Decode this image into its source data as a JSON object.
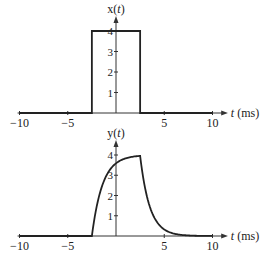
{
  "chart_data": [
    {
      "type": "line",
      "title": "",
      "ylabel": "x(t)",
      "xlabel": "t (ms)",
      "xlim": [
        -10,
        10
      ],
      "ylim": [
        0,
        4
      ],
      "x_ticks": [
        "-10",
        "-5",
        "5",
        "10"
      ],
      "y_ticks": [
        "1",
        "2",
        "3",
        "4"
      ],
      "grid": false,
      "series": [
        {
          "name": "x(t)",
          "x": [
            -10,
            -2.5,
            -2.5,
            2.5,
            2.5,
            10
          ],
          "values": [
            0,
            0,
            4,
            4,
            0,
            0
          ]
        }
      ]
    },
    {
      "type": "line",
      "title": "",
      "ylabel": "y(t)",
      "xlabel": "t (ms)",
      "xlim": [
        -10,
        10
      ],
      "ylim": [
        0,
        4
      ],
      "x_ticks": [
        "-10",
        "-5",
        "5",
        "10"
      ],
      "y_ticks": [
        "1",
        "2",
        "3",
        "4"
      ],
      "grid": false,
      "series": [
        {
          "name": "y(t)",
          "x": [
            -10,
            -2.5,
            -2,
            -1.5,
            -1,
            -0.5,
            0,
            1,
            2,
            2.5,
            3,
            3.5,
            4,
            5,
            6,
            7,
            8,
            10
          ],
          "values": [
            0,
            0,
            1.7,
            2.6,
            3.1,
            3.45,
            3.65,
            3.85,
            3.95,
            3.98,
            2.4,
            1.45,
            0.9,
            0.33,
            0.12,
            0.04,
            0.01,
            0
          ]
        }
      ]
    }
  ],
  "labels": {
    "top_ylabel": "x(t)",
    "bottom_ylabel": "y(t)",
    "xlabel": "t (ms)"
  }
}
